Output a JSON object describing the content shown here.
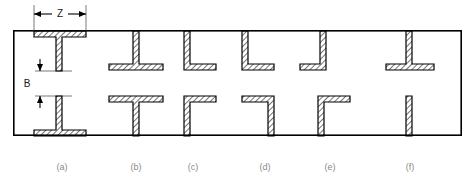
{
  "figure": {
    "type": "engineering-cross-section-diagram",
    "background_color": "#ffffff",
    "line_color": "#000000",
    "hatch_color": "#000000",
    "caption_color": "#8a8a8a",
    "frame": {
      "x": 13,
      "y": 30,
      "width": 449,
      "height": 106,
      "stroke_width": 1.6
    },
    "dimensions": [
      {
        "name": "Z",
        "label": "Z",
        "orientation": "horizontal",
        "label_x": 60,
        "label_y": 13,
        "line_y": 14,
        "from_x": 34,
        "to_x": 86,
        "ext_top": 4,
        "ext_bottom": 30
      },
      {
        "name": "B",
        "label": "B",
        "orientation": "vertical",
        "label_x": 27,
        "label_y": 88,
        "line_x": 35,
        "from_y": 61,
        "to_y": 103,
        "ext_left": 35,
        "ext_right": 72
      }
    ],
    "member_thickness": 6,
    "variants": [
      {
        "id": "a",
        "label": "(a)",
        "caption_x": 62,
        "caption_y": 168,
        "top_shape": "inverted-tee-hanging",
        "bottom_shape": "tee-standing",
        "stem_x": 59,
        "flange_left": 34,
        "flange_right": 86,
        "top_flange_at": "top-edge",
        "bottom_flange_at": "bottom-edge"
      },
      {
        "id": "b",
        "label": "(b)",
        "caption_x": 136,
        "caption_y": 168,
        "top_shape": "tee-hanging",
        "bottom_shape": "tee-standing",
        "stem_x": 136,
        "flange_left": 111,
        "flange_right": 161,
        "top_flange_at": "mid-upper",
        "bottom_flange_at": "mid-lower"
      },
      {
        "id": "c",
        "label": "(c)",
        "caption_x": 193,
        "caption_y": 168,
        "top_shape": "angle-L",
        "bottom_shape": "angle-gamma-down",
        "stem_x": 190,
        "flange_left": 190,
        "flange_right": 216,
        "top_flange_at": "mid-upper",
        "bottom_flange_at": "mid-lower"
      },
      {
        "id": "d",
        "label": "(d)",
        "caption_x": 265,
        "caption_y": 168,
        "top_shape": "angle-L",
        "bottom_shape": "angle-reverse-gamma",
        "stem_x": 248,
        "flange_left": 248,
        "flange_right": 274,
        "top_flange_at": "mid-upper",
        "bottom_flange_at": "mid-lower"
      },
      {
        "id": "e",
        "label": "(e)",
        "caption_x": 330,
        "caption_y": 168,
        "top_shape": "angle-J-left",
        "bottom_shape": "angle-gamma-down",
        "stem_x": 324,
        "flange_left": 300,
        "flange_right": 326,
        "top_flange_at": "mid-upper",
        "bottom_flange_at": "mid-lower"
      },
      {
        "id": "f",
        "label": "(f)",
        "caption_x": 410,
        "caption_y": 168,
        "top_shape": "tee-hanging",
        "bottom_shape": "plain-bar",
        "stem_x": 409,
        "flange_left": 387,
        "flange_right": 432,
        "top_flange_at": "mid-upper",
        "bottom_flange_at": "none"
      }
    ],
    "geometry": {
      "top_edge_y": 30,
      "bottom_edge_y": 136,
      "upper_flange_y": 70,
      "lower_flange_y": 96,
      "thickness": 6
    }
  }
}
